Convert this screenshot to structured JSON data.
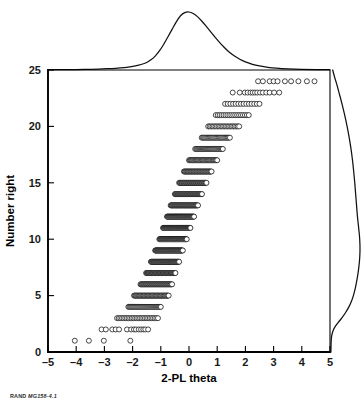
{
  "figure": {
    "footer_prefix": "RAND",
    "footer_id": "MG158-4.1"
  },
  "chart_data": {
    "type": "scatter",
    "title": "",
    "subtitle": "",
    "xlabel": "2-PL theta",
    "ylabel": "Number right",
    "xlim": [
      -5,
      5
    ],
    "ylim": [
      0,
      25
    ],
    "xticks": [
      -5,
      -4,
      -3,
      -2,
      -1,
      0,
      1,
      2,
      3,
      4,
      5
    ],
    "xticklabels": [
      "–5",
      "–4",
      "–3",
      "–2",
      "–1",
      "0",
      "1",
      "2",
      "3",
      "4",
      "5"
    ],
    "yticks": [
      0,
      5,
      10,
      15,
      20,
      25
    ],
    "yticklabels": [
      "0",
      "5",
      "10",
      "15",
      "20",
      "25"
    ],
    "grid": false,
    "legend": "none",
    "marker": "open-circle",
    "marker_color": "#ffffff",
    "marker_edge_color": "#0d0d0d",
    "rows": [
      {
        "number_right": 1,
        "theta_min": -4.05,
        "theta_max": -2.05,
        "count": 4,
        "sparse": true,
        "thetas": [
          -4.05,
          -3.55,
          -3.02,
          -2.08
        ]
      },
      {
        "number_right": 2,
        "theta_min": -3.1,
        "theta_max": -1.45,
        "count": 14,
        "sparse": true,
        "thetas": [
          -3.1,
          -2.95,
          -2.72,
          -2.6,
          -2.48,
          -2.2,
          -2.05,
          -1.95,
          -1.88,
          -1.78,
          -1.7,
          -1.62,
          -1.55,
          -1.45
        ]
      },
      {
        "number_right": 3,
        "theta_min": -2.55,
        "theta_max": -1.1,
        "count": 26,
        "sparse": false
      },
      {
        "number_right": 4,
        "theta_min": -2.15,
        "theta_max": -1.0,
        "count": 34,
        "sparse": false
      },
      {
        "number_right": 5,
        "theta_min": -1.95,
        "theta_max": -0.72,
        "count": 44,
        "sparse": false
      },
      {
        "number_right": 6,
        "theta_min": -1.72,
        "theta_max": -0.6,
        "count": 48,
        "sparse": false
      },
      {
        "number_right": 7,
        "theta_min": -1.52,
        "theta_max": -0.48,
        "count": 52,
        "sparse": false
      },
      {
        "number_right": 8,
        "theta_min": -1.35,
        "theta_max": -0.35,
        "count": 56,
        "sparse": false
      },
      {
        "number_right": 9,
        "theta_min": -1.2,
        "theta_max": -0.22,
        "count": 58,
        "sparse": false
      },
      {
        "number_right": 10,
        "theta_min": -1.05,
        "theta_max": -0.08,
        "count": 58,
        "sparse": false
      },
      {
        "number_right": 11,
        "theta_min": -0.92,
        "theta_max": 0.05,
        "count": 56,
        "sparse": false
      },
      {
        "number_right": 12,
        "theta_min": -0.78,
        "theta_max": 0.18,
        "count": 54,
        "sparse": false
      },
      {
        "number_right": 13,
        "theta_min": -0.65,
        "theta_max": 0.32,
        "count": 50,
        "sparse": false
      },
      {
        "number_right": 14,
        "theta_min": -0.5,
        "theta_max": 0.46,
        "count": 46,
        "sparse": false
      },
      {
        "number_right": 15,
        "theta_min": -0.35,
        "theta_max": 0.62,
        "count": 42,
        "sparse": false
      },
      {
        "number_right": 16,
        "theta_min": -0.18,
        "theta_max": 0.8,
        "count": 38,
        "sparse": false
      },
      {
        "number_right": 17,
        "theta_min": 0.0,
        "theta_max": 1.0,
        "count": 34,
        "sparse": false
      },
      {
        "number_right": 18,
        "theta_min": 0.22,
        "theta_max": 1.2,
        "count": 30,
        "sparse": false
      },
      {
        "number_right": 19,
        "theta_min": 0.45,
        "theta_max": 1.45,
        "count": 26,
        "sparse": false
      },
      {
        "number_right": 20,
        "theta_min": 0.68,
        "theta_max": 1.78,
        "count": 22,
        "sparse": false
      },
      {
        "number_right": 21,
        "theta_min": 0.95,
        "theta_max": 2.12,
        "count": 18,
        "sparse": false
      },
      {
        "number_right": 22,
        "theta_min": 1.28,
        "theta_max": 2.5,
        "count": 14,
        "sparse": false
      },
      {
        "number_right": 23,
        "theta_min": 1.55,
        "theta_max": 3.2,
        "count": 14,
        "sparse": true,
        "thetas": [
          1.55,
          1.8,
          1.98,
          2.08,
          2.18,
          2.26,
          2.34,
          2.42,
          2.52,
          2.62,
          2.74,
          2.86,
          3.02,
          3.2
        ]
      },
      {
        "number_right": 24,
        "theta_min": 2.45,
        "theta_max": 4.45,
        "count": 10,
        "sparse": true,
        "thetas": [
          2.45,
          2.62,
          2.86,
          3.0,
          3.14,
          3.4,
          3.62,
          3.88,
          4.18,
          4.45
        ]
      }
    ],
    "top_density": {
      "name": "2-PL theta density",
      "orientation": "horizontal",
      "peak_x": -0.25,
      "x": [
        -5.0,
        -4.5,
        -4.0,
        -3.6,
        -3.2,
        -2.9,
        -2.6,
        -2.3,
        -2.1,
        -1.9,
        -1.7,
        -1.5,
        -1.35,
        -1.2,
        -1.05,
        -0.9,
        -0.75,
        -0.6,
        -0.45,
        -0.3,
        -0.15,
        0.0,
        0.15,
        0.3,
        0.45,
        0.6,
        0.75,
        0.9,
        1.05,
        1.2,
        1.4,
        1.6,
        1.8,
        2.0,
        2.25,
        2.5,
        2.8,
        3.1,
        3.5,
        4.0,
        4.5,
        5.0
      ],
      "y": [
        0.005,
        0.006,
        0.008,
        0.011,
        0.016,
        0.022,
        0.03,
        0.042,
        0.055,
        0.072,
        0.095,
        0.13,
        0.175,
        0.24,
        0.33,
        0.44,
        0.57,
        0.7,
        0.83,
        0.935,
        0.99,
        1.0,
        0.975,
        0.92,
        0.845,
        0.76,
        0.67,
        0.58,
        0.495,
        0.415,
        0.32,
        0.245,
        0.185,
        0.14,
        0.098,
        0.07,
        0.046,
        0.031,
        0.019,
        0.011,
        0.007,
        0.005
      ]
    },
    "right_density": {
      "name": "Number right density",
      "orientation": "vertical",
      "peak_y": 10.0,
      "y": [
        0.0,
        0.5,
        1.0,
        1.4,
        1.8,
        2.2,
        2.6,
        3.0,
        3.5,
        4.0,
        4.5,
        5.0,
        5.5,
        6.0,
        6.5,
        7.0,
        7.5,
        8.0,
        8.5,
        9.0,
        9.5,
        10.0,
        10.5,
        11.0,
        11.5,
        12.0,
        12.5,
        13.0,
        14.0,
        15.0,
        16.0,
        17.0,
        18.0,
        19.0,
        20.0,
        21.0,
        22.0,
        23.0,
        23.6,
        24.0,
        24.4,
        25.0
      ],
      "x": [
        0.03,
        0.034,
        0.04,
        0.055,
        0.09,
        0.16,
        0.27,
        0.39,
        0.52,
        0.63,
        0.715,
        0.78,
        0.83,
        0.87,
        0.905,
        0.935,
        0.96,
        0.98,
        0.993,
        1.0,
        0.998,
        0.99,
        0.975,
        0.955,
        0.935,
        0.915,
        0.9,
        0.885,
        0.855,
        0.825,
        0.79,
        0.75,
        0.7,
        0.64,
        0.57,
        0.49,
        0.4,
        0.3,
        0.24,
        0.195,
        0.15,
        0.09
      ]
    }
  }
}
